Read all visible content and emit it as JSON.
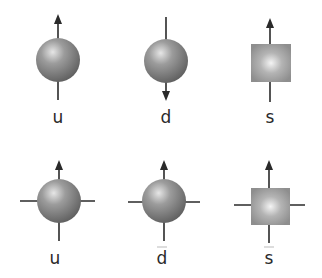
{
  "diagram": {
    "colors": {
      "body": "#8a8a8a",
      "highlight": "#e8e8e8",
      "line": "#2a2a2a",
      "square": "#a0a0a0"
    },
    "rows": [
      {
        "name": "quarks",
        "items": [
          {
            "label": "u",
            "shape": "sphere",
            "spin": "up"
          },
          {
            "label": "d",
            "shape": "sphere",
            "spin": "down"
          },
          {
            "label": "s",
            "shape": "square",
            "spin": "up"
          }
        ]
      },
      {
        "name": "antiquarks",
        "items": [
          {
            "label": "u",
            "shape": "sphere",
            "spin": "up",
            "overbar": true
          },
          {
            "label": "d",
            "shape": "sphere",
            "spin": "up",
            "overbar": true
          },
          {
            "label": "s",
            "shape": "square",
            "spin": "up",
            "overbar": true
          }
        ]
      }
    ]
  }
}
